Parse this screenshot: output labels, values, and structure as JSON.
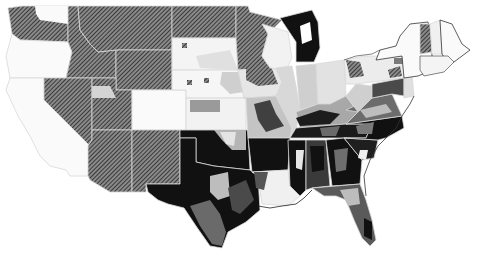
{
  "map": {
    "type": "choropleth",
    "region": "Contiguous United States",
    "background": "#ffffff",
    "legend": [
      {
        "name": "hatched",
        "color": "#5a5a5a",
        "pattern": "diagonal-hatch"
      },
      {
        "name": "black",
        "color": "#111111"
      },
      {
        "name": "dark-gray",
        "color": "#3f3f3f"
      },
      {
        "name": "medium-gray",
        "color": "#888888"
      },
      {
        "name": "light-gray",
        "color": "#c8c8c8"
      },
      {
        "name": "very-light-gray",
        "color": "#e4e4e4"
      },
      {
        "name": "white",
        "color": "#fafafa"
      }
    ],
    "states": [
      {
        "id": "WA",
        "fill": "hatched"
      },
      {
        "id": "OR",
        "fill": "white"
      },
      {
        "id": "CA",
        "fill": "white"
      },
      {
        "id": "ID",
        "fill": "hatched"
      },
      {
        "id": "NV",
        "fill": "hatched"
      },
      {
        "id": "MT",
        "fill": "hatched"
      },
      {
        "id": "WY",
        "fill": "hatched"
      },
      {
        "id": "UT",
        "fill": "hatched"
      },
      {
        "id": "AZ",
        "fill": "hatched"
      },
      {
        "id": "CO",
        "fill": "white"
      },
      {
        "id": "NM",
        "fill": "hatched"
      },
      {
        "id": "ND",
        "fill": "hatched"
      },
      {
        "id": "SD",
        "fill": "white"
      },
      {
        "id": "NE",
        "fill": "white"
      },
      {
        "id": "KS",
        "fill": "mixed"
      },
      {
        "id": "OK",
        "fill": "mixed"
      },
      {
        "id": "TX",
        "fill": "mixed"
      },
      {
        "id": "MN",
        "fill": "hatched"
      },
      {
        "id": "IA",
        "fill": "mixed"
      },
      {
        "id": "MO",
        "fill": "mixed"
      },
      {
        "id": "AR",
        "fill": "black"
      },
      {
        "id": "LA",
        "fill": "mixed"
      },
      {
        "id": "WI",
        "fill": "mixed"
      },
      {
        "id": "IL",
        "fill": "mixed"
      },
      {
        "id": "MI",
        "fill": "black"
      },
      {
        "id": "IN",
        "fill": "mixed"
      },
      {
        "id": "OH",
        "fill": "mixed"
      },
      {
        "id": "KY",
        "fill": "mixed"
      },
      {
        "id": "TN",
        "fill": "mixed"
      },
      {
        "id": "MS",
        "fill": "mixed"
      },
      {
        "id": "AL",
        "fill": "mixed"
      },
      {
        "id": "GA",
        "fill": "mixed"
      },
      {
        "id": "FL",
        "fill": "mixed"
      },
      {
        "id": "SC",
        "fill": "mixed"
      },
      {
        "id": "NC",
        "fill": "mixed"
      },
      {
        "id": "VA",
        "fill": "mixed"
      },
      {
        "id": "WV",
        "fill": "light-gray"
      },
      {
        "id": "PA",
        "fill": "mixed"
      },
      {
        "id": "NY",
        "fill": "white"
      },
      {
        "id": "VT",
        "fill": "hatched"
      },
      {
        "id": "NH",
        "fill": "white"
      },
      {
        "id": "ME",
        "fill": "white"
      },
      {
        "id": "MA",
        "fill": "white"
      },
      {
        "id": "NJ",
        "fill": "mixed"
      },
      {
        "id": "MD",
        "fill": "mixed"
      },
      {
        "id": "DE",
        "fill": "mixed"
      }
    ]
  }
}
